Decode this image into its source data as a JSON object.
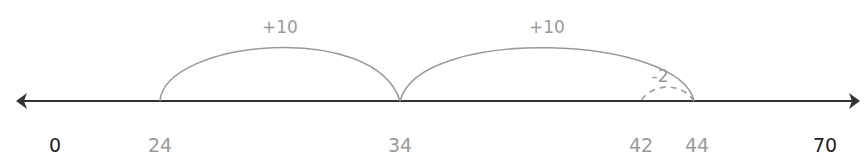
{
  "diagram": {
    "type": "number-line",
    "range": [
      0,
      70
    ],
    "endpoint_labels": [
      {
        "value": 0,
        "text": "0"
      },
      {
        "value": 70,
        "text": "70"
      }
    ],
    "marked_points": [
      {
        "value": 24,
        "text": "24"
      },
      {
        "value": 34,
        "text": "34"
      },
      {
        "value": 42,
        "text": "42"
      },
      {
        "value": 44,
        "text": "44"
      }
    ],
    "jumps": [
      {
        "from": 24,
        "to": 34,
        "label": "+10",
        "style": "solid"
      },
      {
        "from": 34,
        "to": 44,
        "label": "+10",
        "style": "solid"
      },
      {
        "from": 44,
        "to": 42,
        "label": "-2",
        "style": "dashed"
      }
    ],
    "colors": {
      "axis": "#333333",
      "endpoint_text": "#222222",
      "marks": "#9a9a9a"
    }
  }
}
